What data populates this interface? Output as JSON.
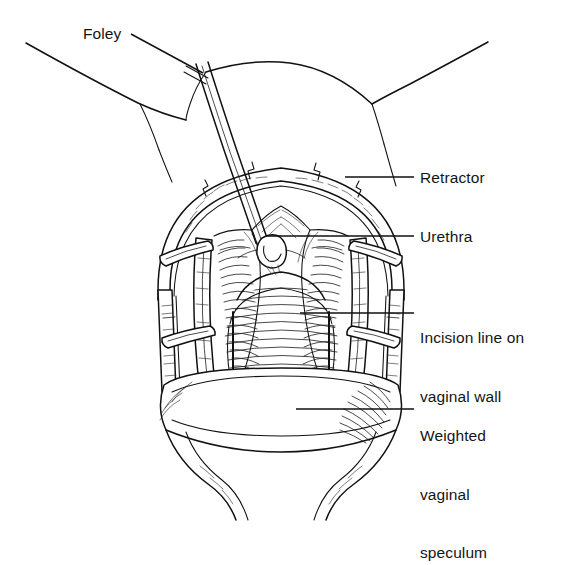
{
  "figure": {
    "domain": "medical-illustration",
    "style": "black-and-white pen-and-ink line art on white background",
    "canvas": {
      "width": 562,
      "height": 538,
      "background": "#ffffff",
      "ink": "#111111"
    }
  },
  "labels": [
    {
      "id": "foley",
      "text": "Foley",
      "lines": [
        "Foley"
      ]
    },
    {
      "id": "retractor",
      "text": "Retractor",
      "lines": [
        "Retractor"
      ]
    },
    {
      "id": "urethra",
      "text": "Urethra",
      "lines": [
        "Urethra"
      ]
    },
    {
      "id": "incision",
      "text": "Incision line on vaginal wall",
      "lines": [
        "Incision line on",
        "vaginal wall"
      ]
    },
    {
      "id": "speculum",
      "text": "Weighted vaginal speculum",
      "lines": [
        "Weighted",
        "vaginal",
        "speculum"
      ]
    }
  ],
  "label_text": {
    "foley": "Foley",
    "retractor": "Retractor",
    "urethra": "Urethra",
    "incision_line_1": "Incision line on",
    "incision_line_2": "vaginal wall",
    "speculum_line_1": "Weighted",
    "speculum_line_2": "vaginal",
    "speculum_line_3": "speculum"
  },
  "structures": [
    {
      "name": "thigh-left",
      "label_ref": null
    },
    {
      "name": "thigh-right",
      "label_ref": null
    },
    {
      "name": "mons-and-labia",
      "label_ref": null
    },
    {
      "name": "foley-catheter",
      "label_ref": "foley"
    },
    {
      "name": "ring-retractor",
      "label_ref": "retractor"
    },
    {
      "name": "urethral-meatus",
      "label_ref": "urethra"
    },
    {
      "name": "vaginal-wall-incision",
      "label_ref": "incision"
    },
    {
      "name": "weighted-speculum",
      "label_ref": "speculum"
    }
  ]
}
